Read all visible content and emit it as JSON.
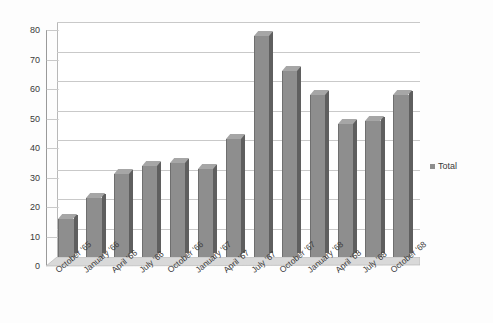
{
  "chart_data": {
    "type": "bar",
    "title": "",
    "xlabel": "",
    "ylabel": "",
    "ylim": [
      0,
      80
    ],
    "yticks": [
      0,
      10,
      20,
      30,
      40,
      50,
      60,
      70,
      80
    ],
    "grid": true,
    "legend_position": "right",
    "style": "3d-column",
    "bar_color": "#8e8e8e",
    "categories": [
      "October '65",
      "January '66",
      "April '66",
      "July '66",
      "October '66",
      "January '67",
      "April '67",
      "July '67",
      "October '67",
      "January '68",
      "April '68",
      "July '68",
      "October '68"
    ],
    "series": [
      {
        "name": "Total",
        "values": [
          13,
          20,
          28,
          31,
          32,
          30,
          40,
          75,
          63,
          55,
          45,
          46,
          55
        ]
      }
    ]
  },
  "legend": {
    "items": [
      {
        "label": "Total",
        "color": "#8e8e8e"
      }
    ]
  }
}
